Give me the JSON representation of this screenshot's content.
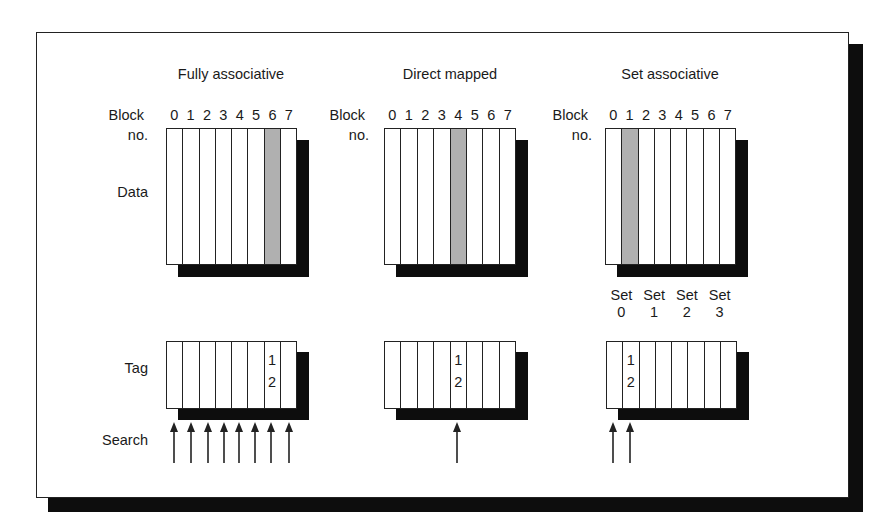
{
  "diagram": {
    "row_labels": {
      "block": "Block",
      "no": "no.",
      "data": "Data",
      "tag": "Tag",
      "search": "Search"
    },
    "columns": [
      "0",
      "1",
      "2",
      "3",
      "4",
      "5",
      "6",
      "7"
    ],
    "panels": [
      {
        "title": "Fully associative",
        "highlighted_block": 6,
        "tag_column": 6,
        "tag_value": [
          "1",
          "2"
        ],
        "search_arrows": 8
      },
      {
        "title": "Direct mapped",
        "highlighted_block": 4,
        "tag_column": 4,
        "tag_value": [
          "1",
          "2"
        ],
        "search_arrows": 1
      },
      {
        "title": "Set associative",
        "highlighted_block": 1,
        "tag_column": 1,
        "tag_value": [
          "1",
          "2"
        ],
        "search_arrows": 2,
        "sets": [
          {
            "label": "Set",
            "num": "0"
          },
          {
            "label": "Set",
            "num": "1"
          },
          {
            "label": "Set",
            "num": "2"
          },
          {
            "label": "Set",
            "num": "3"
          }
        ]
      }
    ],
    "colors": {
      "highlight": "#b0b0b0",
      "shadow": "#0d0d0d",
      "line": "#222222"
    }
  }
}
